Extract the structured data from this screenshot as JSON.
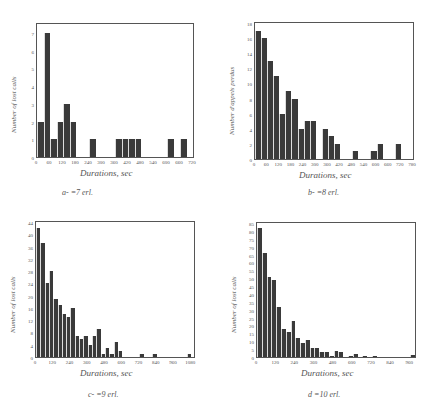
{
  "chart_data": [
    {
      "id": "a",
      "type": "bar",
      "caption": "a-      =7 erl.",
      "xlabel": "Durations, sec",
      "ylabel": "Number of lost calls",
      "xlim": [
        0,
        720
      ],
      "ylim": [
        0,
        7.5
      ],
      "bin_width": 30,
      "xticks": [
        0,
        60,
        120,
        180,
        240,
        300,
        360,
        420,
        480,
        540,
        600,
        660,
        720
      ],
      "yticks": [
        0,
        1,
        2,
        3,
        4,
        5,
        6,
        7
      ],
      "values": [
        2,
        7,
        1,
        2,
        3,
        2,
        0,
        0,
        1,
        0,
        0,
        0,
        1,
        1,
        1,
        1,
        0,
        0,
        0,
        0,
        1,
        0,
        1,
        0
      ]
    },
    {
      "id": "b",
      "type": "bar",
      "caption": "b-      =8 erl.",
      "xlabel": "Durations, sec",
      "ylabel": "Number d'appels perdus",
      "xlim": [
        0,
        780
      ],
      "ylim": [
        0,
        18
      ],
      "bin_width": 30,
      "xticks": [
        0,
        60,
        120,
        180,
        240,
        300,
        360,
        420,
        480,
        540,
        600,
        660,
        720,
        780
      ],
      "yticks": [
        0,
        2,
        4,
        6,
        8,
        10,
        12,
        14,
        16,
        18
      ],
      "values": [
        17,
        16,
        13,
        11,
        6,
        9,
        8,
        4,
        5,
        5,
        0,
        4,
        3,
        2,
        0,
        0,
        1,
        0,
        0,
        1,
        2,
        0,
        0,
        2,
        0,
        0
      ]
    },
    {
      "id": "c",
      "type": "bar",
      "caption": "c-      =9 erl.",
      "xlabel": "Durations, sec",
      "ylabel": "Number of lost calls",
      "xlim": [
        0,
        1100
      ],
      "ylim": [
        0,
        44
      ],
      "bin_width": 30,
      "xticks": [
        0,
        120,
        240,
        360,
        480,
        600,
        720,
        840,
        960,
        1080
      ],
      "ytick_labels": [
        0,
        4,
        8,
        12,
        16,
        20,
        24,
        28,
        32,
        36,
        40,
        44
      ],
      "yticks": [
        0,
        4,
        8,
        12,
        16,
        20,
        24,
        28,
        32,
        36,
        40,
        44
      ],
      "values": [
        42,
        37,
        24,
        28,
        19,
        17,
        14,
        13,
        16,
        7,
        6,
        7,
        4,
        7,
        9,
        1,
        3,
        1,
        5,
        2,
        0,
        0,
        0,
        0,
        1,
        0,
        0,
        1,
        0,
        0,
        0,
        0,
        0,
        0,
        0,
        1
      ]
    },
    {
      "id": "d",
      "type": "bar",
      "caption": "d      =10 erl.",
      "xlabel": "Durations, sec",
      "ylabel": "Number of lost calls",
      "xlim": [
        0,
        990
      ],
      "ylim": [
        0,
        85
      ],
      "bin_width": 30,
      "xticks": [
        0,
        120,
        240,
        360,
        480,
        600,
        720,
        840,
        960
      ],
      "yticks": [
        0,
        5,
        10,
        15,
        20,
        25,
        30,
        35,
        40,
        45,
        50,
        55,
        60,
        65,
        70,
        75,
        80,
        85
      ],
      "values": [
        82,
        66,
        51,
        49,
        32,
        18,
        16,
        23,
        12,
        9,
        11,
        6,
        6,
        3,
        3,
        0.5,
        4,
        3,
        0,
        0.5,
        2,
        0,
        0.5,
        0,
        0.5,
        0,
        0,
        0,
        0,
        0,
        0,
        0,
        1
      ]
    }
  ]
}
